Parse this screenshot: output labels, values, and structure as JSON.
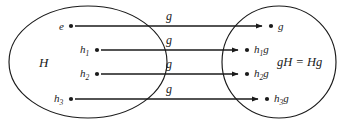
{
  "diagram": {
    "stroke_color": "#1a1a1a",
    "background_color": "#ffffff",
    "left_set": {
      "label": "H",
      "elements": [
        {
          "label": "e",
          "sub": ""
        },
        {
          "label": "h",
          "sub": "1"
        },
        {
          "label": "h",
          "sub": "2"
        },
        {
          "label": "h",
          "sub": "3"
        }
      ]
    },
    "right_set": {
      "label": "gH = Hg",
      "elements": [
        {
          "label": "g",
          "sub": "",
          "suffix": ""
        },
        {
          "label": "h",
          "sub": "1",
          "suffix": "g"
        },
        {
          "label": "h",
          "sub": "2",
          "suffix": "g"
        },
        {
          "label": "h",
          "sub": "3",
          "suffix": "g"
        }
      ]
    },
    "edges": [
      {
        "label": "g"
      },
      {
        "label": "g"
      },
      {
        "label": "g"
      },
      {
        "label": "g"
      }
    ]
  }
}
